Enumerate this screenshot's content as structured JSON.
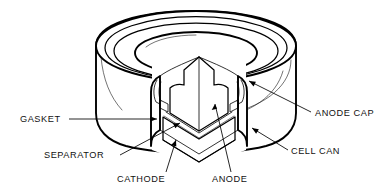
{
  "figure": {
    "style": "technical line drawing, black ink on white",
    "background_color": "#ffffff",
    "ink_color": "#000000"
  },
  "callouts": [
    {
      "id": "gasket",
      "label": "GASKET",
      "side": "left",
      "text_x": 20,
      "text_y": 122,
      "anchor": "start",
      "leader": "M 69 119 L 157 119",
      "arrow": "M 157 119 L 150.5 116.4 L 150.5 121.6 Z",
      "description": "horizontal leader pointing right into the sealed rim"
    },
    {
      "id": "separator",
      "label": "SEPARATOR",
      "side": "left",
      "text_x": 44,
      "text_y": 158,
      "anchor": "start",
      "leader": "M 120 155 L 180 123",
      "arrow": "M 180 123 L 173.0 123.6 L 175.4 128.2 Z",
      "description": "leader rising to the right toward the thin separator layer"
    },
    {
      "id": "cathode",
      "label": "CATHODE",
      "side": "bottom",
      "text_x": 117,
      "text_y": 182,
      "anchor": "start",
      "leader": "M 166 172 L 176 140",
      "arrow": "M 176 140 L 171.2 144.9 L 176.3 146.4 Z",
      "description": "leader rising into the stippled cathode wedge"
    },
    {
      "id": "anode",
      "label": "ANODE",
      "side": "bottom",
      "text_x": 212,
      "text_y": 182,
      "anchor": "start",
      "leader": "M 231 172 L 215 104",
      "arrow": "M 215 104 L 211.7 110.1 L 217.1 108.8 Z",
      "description": "leader rising into the hatched anode wedge"
    },
    {
      "id": "anode-cap",
      "label": "ANODE CAP",
      "side": "right",
      "text_x": 315,
      "text_y": 116,
      "anchor": "start",
      "leader": "M 311 112 L 249 81",
      "arrow": "M 249 81 L 255.9 81.7 L 253.6 86.4 Z",
      "description": "leader rising up-left to the domed top cap"
    },
    {
      "id": "cell-can",
      "label": "CELL CAN",
      "side": "right",
      "text_x": 291,
      "text_y": 154,
      "anchor": "start",
      "leader": "M 288 150 L 252 128",
      "arrow": "M 252 128 L 258.8 129.3 L 256.1 133.8 Z",
      "description": "leader rising up-left to the outer cylindrical can wall"
    }
  ],
  "components": {
    "cell_can": "outer cylindrical steel can forming the body and base",
    "anode_cap": "top cap with concentric stepped rim",
    "gasket": "insulating seal between cap and can at the rim",
    "separator": "thin layer between anode and cathode",
    "anode": "upper hatched wedge material",
    "cathode": "lower stippled wedge material",
    "cutaway": "V-shaped quarter-section removed to reveal the interior"
  }
}
